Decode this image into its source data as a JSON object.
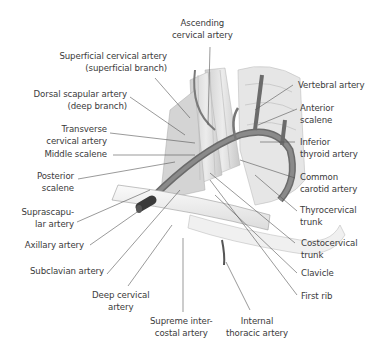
{
  "figure": {
    "labels": {
      "ascending_cervical": [
        "Ascending",
        "cervical artery"
      ],
      "superficial_cervical": [
        "Superficial cervical artery",
        "(superficial branch)"
      ],
      "dorsal_scapular": [
        "Dorsal scapular artery",
        "(deep branch)"
      ],
      "transverse_cervical": [
        "Transverse",
        "cervical artery"
      ],
      "middle_scalene": [
        "Middle scalene"
      ],
      "posterior_scalene": [
        "Posterior",
        "scalene"
      ],
      "suprascapular": [
        "Suprascapu-",
        "lar artery"
      ],
      "axillary": [
        "Axillary artery"
      ],
      "subclavian": [
        "Subclavian artery"
      ],
      "deep_cervical": [
        "Deep cervical",
        "artery"
      ],
      "supreme_intercostal": [
        "Supreme inter-",
        "costal artery"
      ],
      "internal_thoracic": [
        "Internal",
        "thoracic artery"
      ],
      "vertebral": [
        "Vertebral artery"
      ],
      "anterior_scalene": [
        "Anterior",
        "scalene"
      ],
      "inferior_thyroid": [
        "Inferior",
        "thyroid artery"
      ],
      "common_carotid": [
        "Common",
        "carotid artery"
      ],
      "thyrocervical": [
        "Thyrocervical",
        "trunk"
      ],
      "costocervical": [
        "Costocervical",
        "trunk"
      ],
      "clavicle": [
        "Clavicle"
      ],
      "first_rib": [
        "First rib"
      ]
    },
    "colors": {
      "text": "#3a3a3a",
      "leader": "#555555",
      "muscle": "#d9d9d9",
      "artery": "#6b6b6b",
      "bone": "#f2f2f2"
    }
  }
}
